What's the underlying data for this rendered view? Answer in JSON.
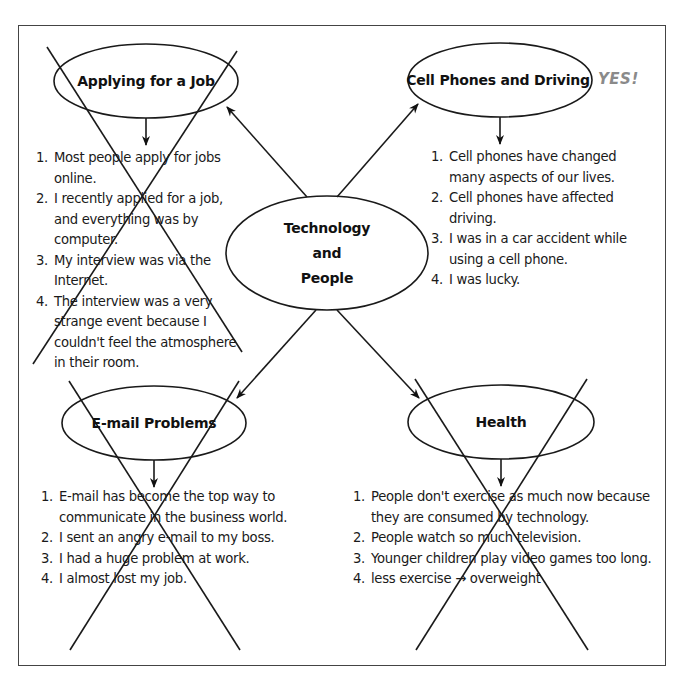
{
  "diagram": {
    "type": "cluster-map",
    "center": {
      "lines": [
        "Technology",
        "and",
        "People"
      ]
    },
    "topics": [
      {
        "id": "applying",
        "title": "Applying for a Job",
        "crossed_out": true,
        "items": [
          "Most people apply for jobs online.",
          "I recently applied for a job, and everything was by computer.",
          "My interview was via the Internet.",
          "The interview was a very strange event because I couldn't feel the atmosphere in their room."
        ]
      },
      {
        "id": "cellphones",
        "title": "Cell Phones and Driving",
        "crossed_out": false,
        "annotation": "YES!",
        "items": [
          "Cell phones have changed many aspects of our lives.",
          "Cell phones have affected driving.",
          "I was in a car accident while using a cell phone.",
          "I was lucky."
        ]
      },
      {
        "id": "email",
        "title": "E-mail Problems",
        "crossed_out": true,
        "items": [
          "E-mail has become the top way to communicate in the business world.",
          "I sent an angry e-mail to my boss.",
          "I had a huge problem at work.",
          "I almost lost my job."
        ]
      },
      {
        "id": "health",
        "title": "Health",
        "crossed_out": true,
        "items": [
          "People don't exercise as much now because they are consumed by technology.",
          "People watch so much television.",
          "Younger children play video games too long.",
          "less exercise → overweight"
        ]
      }
    ],
    "numbers": [
      "1.",
      "2.",
      "3.",
      "4."
    ],
    "colors": {
      "ink": "#1a1a1a",
      "annotation": "#8a8a8a",
      "frame": "#444444"
    }
  }
}
